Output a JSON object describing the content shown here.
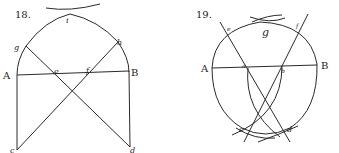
{
  "figures": [
    {
      "number": "18.",
      "labels": {
        "i": "i",
        "g": "g",
        "h": "h",
        "A": "A",
        "B": "B",
        "e": "e",
        "f": "f",
        "c": "c",
        "d": "d"
      }
    },
    {
      "number": "19.",
      "labels": {
        "g": "g",
        "e": "e",
        "f": "f",
        "A": "A",
        "B": "B",
        "a": "a",
        "b": "b",
        "c": "c",
        "d": "d"
      }
    }
  ],
  "colors": {
    "ink": "#2a2a2a",
    "background": "#ffffff"
  }
}
